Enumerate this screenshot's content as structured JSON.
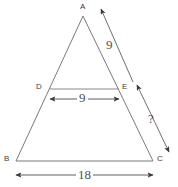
{
  "figure": {
    "kind": "geometry-diagram",
    "shape": "triangle-with-midsegment",
    "background_color": "#ffffff",
    "stroke_color": "#6b6b6b",
    "text_color": "#4a4a4a"
  },
  "vertices": [
    {
      "id": "A",
      "label": "A",
      "x": 83,
      "y": 16,
      "label_x": 80,
      "label_y": 3
    },
    {
      "id": "B",
      "label": "B",
      "x": 16,
      "y": 161,
      "label_x": 4,
      "label_y": 155
    },
    {
      "id": "C",
      "label": "C",
      "x": 153,
      "y": 161,
      "label_x": 157,
      "label_y": 155
    },
    {
      "id": "D",
      "label": "D",
      "x": 50,
      "y": 89,
      "label_x": 36,
      "label_y": 83
    },
    {
      "id": "E",
      "label": "E",
      "x": 119,
      "y": 89,
      "label_x": 122,
      "label_y": 83
    }
  ],
  "segments": [
    {
      "name": "side-AB",
      "from": "A",
      "to": "B"
    },
    {
      "name": "side-AC",
      "from": "A",
      "to": "C"
    },
    {
      "name": "base-BC",
      "from": "B",
      "to": "C"
    },
    {
      "name": "midsegment-DE",
      "from": "D",
      "to": "E"
    }
  ],
  "measurements": [
    {
      "id": "ae",
      "name": "measure-AE",
      "value": "9",
      "label_x": 106,
      "label_y": 38,
      "arrow": {
        "x1": 133,
        "y1": 82,
        "x2": 101,
        "y2": 9
      },
      "describes": "segment A to E along side AC"
    },
    {
      "id": "de",
      "name": "measure-DE",
      "value": "9",
      "label_x": 77,
      "label_y": 91,
      "arrow": {
        "x1": 50,
        "y1": 99,
        "x2": 119,
        "y2": 99
      },
      "describes": "midsegment D to E"
    },
    {
      "id": "ec",
      "name": "measure-EC-unknown",
      "value": "?",
      "label_x": 148,
      "label_y": 112,
      "arrow": {
        "x1": 137,
        "y1": 85,
        "x2": 169,
        "y2": 152
      },
      "describes": "segment E to C along side AC, unknown"
    },
    {
      "id": "bc",
      "name": "measure-BC",
      "value": "18",
      "label_x": 76,
      "label_y": 168,
      "arrow": {
        "x1": 16,
        "y1": 175,
        "x2": 153,
        "y2": 175
      },
      "describes": "base B to C"
    }
  ]
}
